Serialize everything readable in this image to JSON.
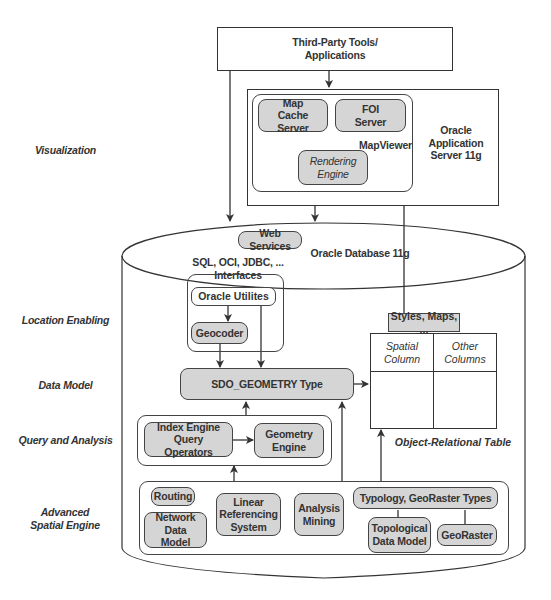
{
  "layers": {
    "visualization": "Visualization",
    "location_enabling": "Location Enabling",
    "data_model": "Data Model",
    "query_and_analysis": "Query and Analysis",
    "advanced_spatial_engine": "Advanced Spatial Engine"
  },
  "top": {
    "third_party": "Third-Party Tools/ Applications",
    "app_server": "Oracle Application Server 11g",
    "mapviewer": "MapViewer",
    "map_cache_server": "Map Cache Server",
    "foi_server": "FOI Server",
    "rendering_engine": "Rendering Engine"
  },
  "database": {
    "title": "Oracle Database 11g",
    "web_services": "Web Services",
    "interfaces": "SQL, OCI, JDBC, ... Interfaces",
    "oracle_utilities": "Oracle Utilites",
    "geocoder": "Geocoder",
    "sdo_geometry": "SDO_GEOMETRY Type",
    "styles_maps": "Styles, Maps, ...",
    "table": {
      "columns": [
        "Spatial Column",
        "Other Columns"
      ],
      "caption": "Object-Relational Table"
    },
    "query": {
      "index_engine": "Index Engine Query Operators",
      "geometry_engine": "Geometry Engine"
    },
    "advanced": {
      "routing": "Routing",
      "network_data_model": "Network Data Model",
      "linear_referencing": "Linear Referencing System",
      "analysis_mining": "Analysis Mining",
      "typology_types": "Typology, GeoRaster Types",
      "topological_data_model": "Topological Data Model",
      "georaster": "GeoRaster"
    }
  }
}
